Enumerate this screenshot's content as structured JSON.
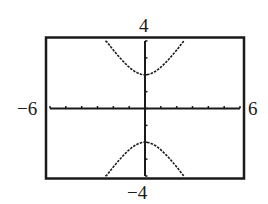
{
  "chart_data": {
    "type": "line",
    "title": "",
    "xlabel": "",
    "ylabel": "",
    "xlim": [
      -6,
      6
    ],
    "ylim": [
      -4,
      4
    ],
    "x_tick_step": 1,
    "y_tick_step": 1,
    "grid": false,
    "legend": null,
    "tick_labels": {
      "xmin": "−6",
      "xmax": "6",
      "ymin": "−4",
      "ymax": "4"
    },
    "series": [
      {
        "name": "upper branch",
        "x": [
          -2.5,
          -2.0,
          -1.5,
          -1.0,
          -0.5,
          0,
          0.5,
          1.0,
          1.5,
          2.0,
          2.5
        ],
        "y": [
          4.0,
          3.46,
          3.0,
          2.45,
          2.12,
          2.0,
          2.12,
          2.45,
          3.0,
          3.46,
          4.0
        ]
      },
      {
        "name": "lower branch",
        "x": [
          -2.5,
          -2.0,
          -1.5,
          -1.0,
          -0.5,
          0,
          0.5,
          1.0,
          1.5,
          2.0,
          2.5
        ],
        "y": [
          -4.0,
          -3.46,
          -3.0,
          -2.45,
          -2.12,
          -2.0,
          -2.12,
          -2.45,
          -3.0,
          -3.46,
          -4.0
        ]
      }
    ],
    "annotations": [
      "Hyperbola with vertices at (0, 2) and (0, −2)"
    ]
  }
}
